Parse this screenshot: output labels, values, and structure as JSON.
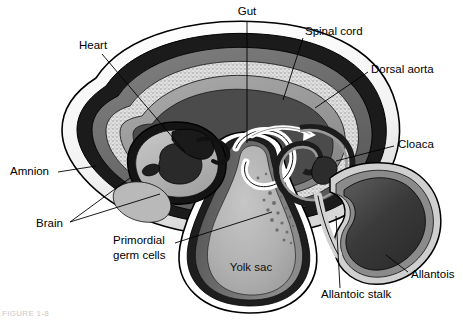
{
  "figure": {
    "title_alt": "Embryo in amnion with yolk sac and allantois",
    "caption": "FIGURE 1-8"
  },
  "colors": {
    "background": "#ffffff",
    "outline": "#000000",
    "amnion_outer_white": "#fdfdfd",
    "amnion_black_band": "#1a1a1a",
    "amnion_mid_gray": "#8e8e8e",
    "chorion_gray": "#6f6f6f",
    "stipple_light": "#dcdcdc",
    "body_gray": "#9a9a9a",
    "light_gray": "#bfbfbf",
    "dark_gray": "#4a4a4a",
    "yolk_fill": "#b4b4b4",
    "yolk_shadow": "#5c5c5c",
    "allantois_fill": "#3c3c3c",
    "germ_cell": "#7d7d7d",
    "arrow_white": "#ffffff"
  },
  "labels": [
    {
      "id": "gut",
      "text": "Gut",
      "x": 247,
      "y": 12,
      "anchor": "middle"
    },
    {
      "id": "spinal-cord",
      "text": "Spinal cord",
      "x": 305,
      "y": 32,
      "anchor": "start"
    },
    {
      "id": "dorsal-aorta",
      "text": "Dorsal aorta",
      "x": 371,
      "y": 70,
      "anchor": "start"
    },
    {
      "id": "heart",
      "text": "Heart",
      "x": 79,
      "y": 46,
      "anchor": "start"
    },
    {
      "id": "cloaca",
      "text": "Cloaca",
      "x": 398,
      "y": 145,
      "anchor": "start"
    },
    {
      "id": "amnion",
      "text": "Amnion",
      "x": 10,
      "y": 172,
      "anchor": "start"
    },
    {
      "id": "brain",
      "text": "Brain",
      "x": 36,
      "y": 224,
      "anchor": "start"
    },
    {
      "id": "allantois",
      "text": "Allantois",
      "x": 411,
      "y": 275,
      "anchor": "start"
    },
    {
      "id": "allantoic-stalk",
      "text": "Allantoic stalk",
      "x": 321,
      "y": 295,
      "anchor": "start"
    },
    {
      "id": "yolk-sac",
      "text": "Yolk sac",
      "x": 251,
      "y": 268,
      "anchor": "middle"
    }
  ],
  "multiline_labels": [
    {
      "id": "primordial-germ-cells",
      "lines": [
        "Primordial",
        "germ cells"
      ],
      "x": 113,
      "y": 248,
      "line_height": 15,
      "anchor": "start"
    }
  ],
  "leader_lines": [
    {
      "id": "leader-gut",
      "path": "M 247 22 L 247 143"
    },
    {
      "id": "leader-spinal-cord",
      "path": "M 303 38 L 283 100"
    },
    {
      "id": "leader-dorsal-aorta",
      "path": "M 368 72 L 315 108"
    },
    {
      "id": "leader-heart",
      "path": "M 102 54 L 185 152"
    },
    {
      "id": "leader-cloaca",
      "path": "M 394 146 L 336 161"
    },
    {
      "id": "leader-amnion",
      "path": "M 58 172 L 96 166"
    },
    {
      "id": "leader-brain-a",
      "path": "M 70 222 L 130 178"
    },
    {
      "id": "leader-brain-b",
      "path": "M 70 222 L 160 194"
    },
    {
      "id": "leader-allantois",
      "path": "M 408 272 L 386 255"
    },
    {
      "id": "leader-allantoic-stalk",
      "path": "M 340 288 L 336 216"
    },
    {
      "id": "leader-germ-cells",
      "path": "M 175 243 L 272 212"
    }
  ]
}
